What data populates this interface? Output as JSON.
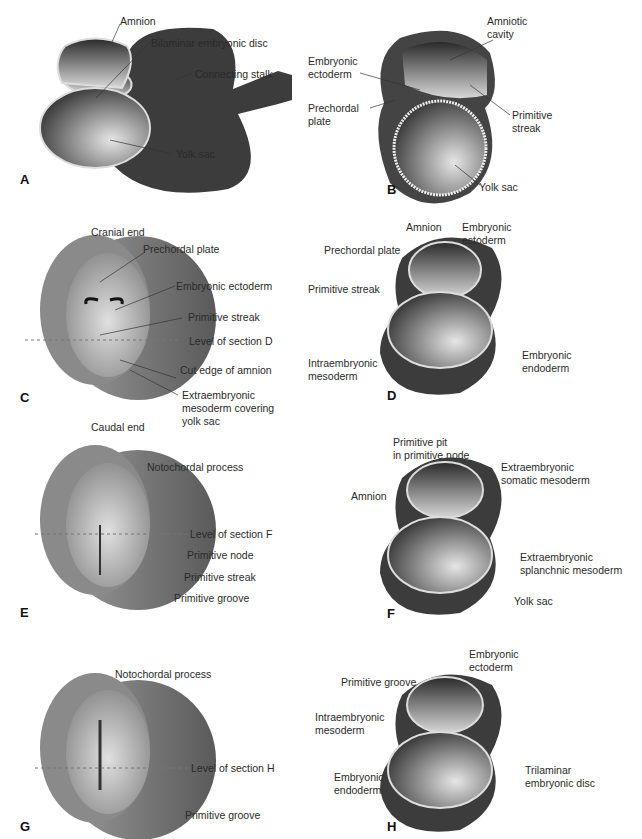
{
  "figure": {
    "panels": [
      {
        "id": "A",
        "letter": "A",
        "labels": {
          "amnion": "Amnion",
          "bilaminar": "Bilaminar embryonic disc",
          "stalk": "Connecting stalk",
          "yolk": "Yolk sac"
        }
      },
      {
        "id": "B",
        "letter": "B",
        "labels": {
          "amniotic_cavity": "Amniotic\ncavity",
          "ectoderm": "Embryonic\nectoderm",
          "prechordal": "Prechordal\nplate",
          "streak": "Primitive\nstreak",
          "yolk": "Yolk sac"
        }
      },
      {
        "id": "C",
        "letter": "C",
        "labels": {
          "cranial": "Cranial end",
          "prechordal": "Prechordal plate",
          "ectoderm": "Embryonic ectoderm",
          "streak": "Primitive streak",
          "level": "Level of section D",
          "cut_edge": "Cut edge of amnion",
          "extra_meso": "Extraembryonic\nmesoderm covering\nyolk sac",
          "caudal": "Caudal end"
        }
      },
      {
        "id": "D",
        "letter": "D",
        "labels": {
          "amnion": "Amnion",
          "ectoderm": "Embryonic\nectoderm",
          "prechordal": "Prechordal plate",
          "streak": "Primitive streak",
          "intra_meso": "Intraembryonic\nmesoderm",
          "endoderm": "Embryonic\nendoderm"
        }
      },
      {
        "id": "E",
        "letter": "E",
        "labels": {
          "notochordal": "Notochordal process",
          "level": "Level of section F",
          "node": "Primitive node",
          "streak": "Primitive streak",
          "groove": "Primitive groove"
        }
      },
      {
        "id": "F",
        "letter": "F",
        "labels": {
          "pit": "Primitive pit\nin primitive node",
          "somatic": "Extraembryonic\nsomatic mesoderm",
          "amnion": "Amnion",
          "splanchnic": "Extraembryonic\nsplanchnic mesoderm",
          "yolk": "Yolk sac"
        }
      },
      {
        "id": "G",
        "letter": "G",
        "labels": {
          "notochordal": "Notochordal process",
          "level": "Level of section H",
          "groove": "Primitive groove"
        }
      },
      {
        "id": "H",
        "letter": "H",
        "labels": {
          "ectoderm": "Embryonic\nectoderm",
          "groove": "Primitive groove",
          "intra_meso": "Intraembryonic\nmesoderm",
          "endoderm": "Embryonic\nendoderm",
          "trilaminar": "Trilaminar\nembryonic disc"
        }
      }
    ]
  },
  "colors": {
    "tissue_dark": "#3a3a3a",
    "tissue_mid": "#7a7a7a",
    "membrane": "#e8e8e8",
    "background": "#ffffff"
  }
}
